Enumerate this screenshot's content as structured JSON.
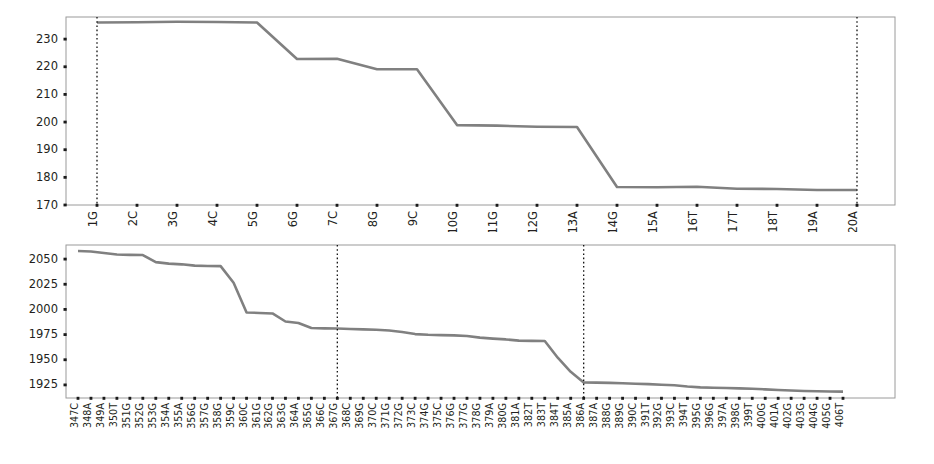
{
  "chart_data": [
    {
      "id": "top",
      "type": "line",
      "title": "",
      "xlabel": "",
      "ylabel": "",
      "ylim": [
        170,
        238
      ],
      "yticks": [
        170,
        180,
        190,
        200,
        210,
        220,
        230
      ],
      "grid": false,
      "legend": "none",
      "line_color": "#808080",
      "marker_color": "#111111",
      "marker_positions": [
        "1G",
        "20A"
      ],
      "categories": [
        "1G",
        "2C",
        "3G",
        "4C",
        "5G",
        "6G",
        "7C",
        "8G",
        "9C",
        "10G",
        "11G",
        "12G",
        "13A",
        "14G",
        "15A",
        "16T",
        "17T",
        "18T",
        "19A",
        "20A"
      ],
      "values": [
        236.0,
        236.1,
        236.3,
        236.2,
        236.0,
        222.8,
        222.9,
        219.1,
        219.1,
        198.9,
        198.7,
        198.3,
        198.2,
        176.5,
        176.4,
        176.6,
        175.9,
        175.8,
        175.4,
        175.4
      ]
    },
    {
      "id": "bottom",
      "type": "line",
      "title": "",
      "xlabel": "",
      "ylabel": "",
      "ylim": [
        1912,
        2064
      ],
      "yticks": [
        1925,
        1950,
        1975,
        2000,
        2025,
        2050
      ],
      "grid": false,
      "legend": "none",
      "line_color": "#808080",
      "marker_color": "#111111",
      "marker_positions": [
        "367G",
        "386A"
      ],
      "categories": [
        "347C",
        "348A",
        "349A",
        "350T",
        "351G",
        "352G",
        "353G",
        "354A",
        "355A",
        "356G",
        "357G",
        "358G",
        "359C",
        "360C",
        "361G",
        "362G",
        "363G",
        "364A",
        "365G",
        "366C",
        "367G",
        "368C",
        "369G",
        "370C",
        "371G",
        "372G",
        "373C",
        "374G",
        "375C",
        "376G",
        "377G",
        "378G",
        "379A",
        "380G",
        "381A",
        "382T",
        "383T",
        "384T",
        "385A",
        "386A",
        "387A",
        "388G",
        "389G",
        "390C",
        "391T",
        "392G",
        "393C",
        "394T",
        "395G",
        "396G",
        "397A",
        "398G",
        "399T",
        "400G",
        "401A",
        "402G",
        "403G",
        "404G",
        "405G",
        "406T"
      ],
      "values": [
        2058.0,
        2057.6,
        2056.0,
        2054.5,
        2054.2,
        2054.0,
        2047.0,
        2045.5,
        2044.8,
        2043.5,
        2043.2,
        2043.0,
        2026.5,
        1997.0,
        1996.5,
        1996.0,
        1988.0,
        1986.5,
        1981.5,
        1981.2,
        1981.0,
        1980.6,
        1980.2,
        1979.8,
        1979.0,
        1977.5,
        1975.5,
        1974.8,
        1974.5,
        1974.2,
        1973.6,
        1972.0,
        1971.0,
        1970.2,
        1969.0,
        1968.8,
        1968.6,
        1952.0,
        1938.0,
        1927.5,
        1927.3,
        1927.0,
        1926.6,
        1926.2,
        1925.8,
        1925.2,
        1924.6,
        1923.4,
        1922.6,
        1922.2,
        1921.9,
        1921.6,
        1921.2,
        1920.6,
        1920.0,
        1919.4,
        1919.0,
        1918.7,
        1918.5,
        1918.3
      ]
    }
  ]
}
